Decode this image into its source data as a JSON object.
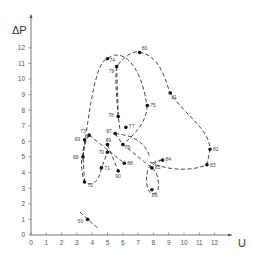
{
  "chart_data": {
    "type": "scatter",
    "title": "",
    "xlabel": "U",
    "ylabel": "ΔP",
    "xlim": [
      0,
      13
    ],
    "ylim": [
      0,
      13
    ],
    "x_ticks": [
      0,
      1,
      2,
      3,
      4,
      5,
      6,
      7,
      8,
      9,
      10,
      11,
      12
    ],
    "y_ticks": [
      0,
      1,
      2,
      3,
      4,
      5,
      6,
      7,
      8,
      9,
      10,
      11,
      12
    ],
    "grid": false,
    "legend": null,
    "points": [
      {
        "label": "50",
        "x": 3.7,
        "y": 1.0
      },
      {
        "label": "68",
        "x": 3.4,
        "y": 5.0
      },
      {
        "label": "69",
        "x": 3.5,
        "y": 6.1
      },
      {
        "label": "70",
        "x": 5.0,
        "y": 5.3
      },
      {
        "label": "71",
        "x": 4.6,
        "y": 4.3
      },
      {
        "label": "72",
        "x": 3.5,
        "y": 3.4
      },
      {
        "label": "73",
        "x": 3.8,
        "y": 6.4
      },
      {
        "label": "74",
        "x": 5.0,
        "y": 11.3
      },
      {
        "label": "75",
        "x": 7.6,
        "y": 8.3
      },
      {
        "label": "76",
        "x": 6.0,
        "y": 5.8
      },
      {
        "label": "77",
        "x": 6.2,
        "y": 6.9
      },
      {
        "label": "78",
        "x": 5.7,
        "y": 7.6
      },
      {
        "label": "79",
        "x": 5.6,
        "y": 10.8
      },
      {
        "label": "80",
        "x": 7.1,
        "y": 11.7
      },
      {
        "label": "81",
        "x": 9.1,
        "y": 9.1
      },
      {
        "label": "82",
        "x": 11.7,
        "y": 5.5
      },
      {
        "label": "83",
        "x": 11.5,
        "y": 4.5
      },
      {
        "label": "84",
        "x": 8.6,
        "y": 4.8
      },
      {
        "label": "85",
        "x": 7.9,
        "y": 4.3
      },
      {
        "label": "86",
        "x": 7.9,
        "y": 2.9
      },
      {
        "label": "87",
        "x": 5.5,
        "y": 6.5
      },
      {
        "label": "88",
        "x": 6.1,
        "y": 4.6
      },
      {
        "label": "89",
        "x": 5.0,
        "y": 5.8
      },
      {
        "label": "90",
        "x": 5.7,
        "y": 4.1
      }
    ],
    "trajectory": "dashed line connecting points in sequence 68→69→73→...; separate short dashed segment through point 50"
  }
}
